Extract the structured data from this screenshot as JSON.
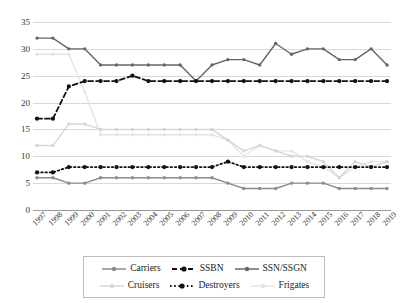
{
  "chart_data": {
    "type": "line",
    "title": "",
    "xlabel": "",
    "ylabel": "",
    "grid": true,
    "legend_position": "bottom",
    "ylim": [
      0,
      35
    ],
    "yticks": [
      0,
      5,
      10,
      15,
      20,
      25,
      30,
      35
    ],
    "categories": [
      "1997",
      "1998",
      "1999",
      "2000",
      "2001",
      "2002",
      "2003",
      "2004",
      "2005",
      "2006",
      "2007",
      "2008",
      "2009",
      "2010",
      "2011",
      "2012",
      "2013",
      "2014",
      "2015",
      "2016",
      "2017",
      "2018",
      "2019"
    ],
    "series": [
      {
        "name": "Carriers",
        "color": "#8c8c8c",
        "style": "solid",
        "values": [
          6,
          6,
          5,
          5,
          6,
          6,
          6,
          6,
          6,
          6,
          6,
          6,
          5,
          4,
          4,
          4,
          5,
          5,
          5,
          4,
          4,
          4,
          4
        ]
      },
      {
        "name": "SSBN",
        "color": "#111111",
        "style": "dashed",
        "values": [
          17,
          17,
          23,
          24,
          24,
          24,
          25,
          24,
          24,
          24,
          24,
          24,
          24,
          24,
          24,
          24,
          24,
          24,
          24,
          24,
          24,
          24,
          24
        ]
      },
      {
        "name": "SSN/SSGN",
        "color": "#666666",
        "style": "solid",
        "values": [
          32,
          32,
          30,
          30,
          27,
          27,
          27,
          27,
          27,
          27,
          24,
          27,
          28,
          28,
          27,
          31,
          29,
          30,
          30,
          28,
          28,
          30,
          27
        ]
      },
      {
        "name": "Cruisers",
        "color": "#d6d6d6",
        "style": "solid",
        "values": [
          12,
          12,
          16,
          16,
          15,
          15,
          15,
          15,
          15,
          15,
          15,
          15,
          13,
          11,
          12,
          11,
          10,
          10,
          9,
          6,
          9,
          8,
          9
        ]
      },
      {
        "name": "Destroyers",
        "color": "#111111",
        "style": "dotted",
        "values": [
          7,
          7,
          8,
          8,
          8,
          8,
          8,
          8,
          8,
          8,
          8,
          8,
          9,
          8,
          8,
          8,
          8,
          8,
          8,
          8,
          8,
          8,
          8
        ]
      },
      {
        "name": "Frigates",
        "color": "#e4e4e4",
        "style": "solid",
        "values": [
          29,
          29,
          29,
          22,
          14,
          14,
          14,
          14,
          14,
          14,
          14,
          14,
          13,
          10,
          12,
          11,
          11,
          9,
          8,
          6,
          8,
          9,
          9
        ]
      }
    ]
  },
  "legend": {
    "rows": [
      [
        {
          "label": "Carriers",
          "key": "carriers"
        },
        {
          "label": "SSBN",
          "key": "ssbn"
        },
        {
          "label": "SSN/SSGN",
          "key": "ssn-ssgn"
        }
      ],
      [
        {
          "label": "Cruisers",
          "key": "cruisers"
        },
        {
          "label": "Destroyers",
          "key": "destroyers"
        },
        {
          "label": "Frigates",
          "key": "frigates"
        }
      ]
    ]
  }
}
